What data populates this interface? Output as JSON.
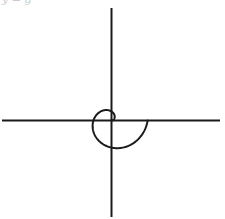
{
  "title_fragment": "y = g",
  "chart_data": {
    "type": "line",
    "subtype": "polar-curve",
    "title": "",
    "equation": "r = θ",
    "theta_range": [
      0,
      6.2832
    ],
    "xlabel": "",
    "ylabel": "",
    "grid": false,
    "legend": null,
    "axes": {
      "origin_px": [
        111.5,
        120.5
      ],
      "x_axis_px": [
        2,
        220
      ],
      "y_axis_px": [
        8,
        217
      ],
      "scale_px_per_unit": 5.75
    },
    "series": [
      {
        "name": "spiral",
        "color": "#1a1a1a",
        "points_polar_theta_r": [
          [
            0,
            0
          ],
          [
            0.785,
            0.785
          ],
          [
            1.571,
            1.571
          ],
          [
            2.356,
            2.356
          ],
          [
            3.142,
            3.142
          ],
          [
            3.927,
            3.927
          ],
          [
            4.712,
            4.712
          ],
          [
            5.498,
            5.498
          ],
          [
            6.283,
            6.283
          ]
        ]
      }
    ],
    "colors": {
      "axis": "#1a1a1a",
      "curve": "#1a1a1a",
      "background": "#ffffff"
    }
  }
}
